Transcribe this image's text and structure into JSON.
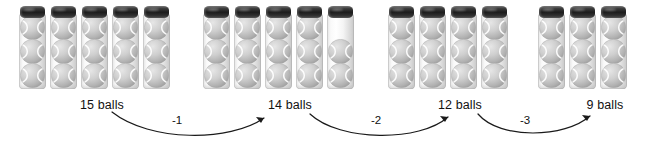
{
  "figure": {
    "background_color": "#ffffff",
    "text_color": "#111111"
  },
  "chart_data": {
    "type": "bar",
    "xlabel": "",
    "ylabel": "balls",
    "categories": [
      "15 balls",
      "14 balls",
      "12 balls",
      "9 balls"
    ],
    "values": [
      15,
      14,
      12,
      9
    ],
    "series": [
      {
        "name": "balls",
        "values": [
          15,
          14,
          12,
          9
        ]
      }
    ],
    "deltas": [
      -1,
      -2,
      -3
    ],
    "grid": false,
    "legend_position": "none",
    "annotations": [
      "-1",
      "-2",
      "-3"
    ]
  },
  "groups": [
    {
      "id": "group-1",
      "label": "15 balls",
      "total": 15,
      "tube_count": 5,
      "tubes": [
        3,
        3,
        3,
        3,
        3
      ],
      "label_x": 102
    },
    {
      "id": "group-2",
      "label": "14 balls",
      "total": 14,
      "tube_count": 5,
      "tubes": [
        3,
        3,
        3,
        3,
        2
      ],
      "label_x": 290
    },
    {
      "id": "group-3",
      "label": "12 balls",
      "total": 12,
      "tube_count": 4,
      "tubes": [
        3,
        3,
        3,
        3
      ],
      "label_x": 460
    },
    {
      "id": "group-4",
      "label": "9 balls",
      "total": 9,
      "tube_count": 3,
      "tubes": [
        3,
        3,
        3
      ],
      "label_x": 605
    }
  ],
  "arrows": [
    {
      "id": "arrow-1",
      "label": "-1",
      "from": "15 balls",
      "to": "14 balls",
      "label_x": 177
    },
    {
      "id": "arrow-2",
      "label": "-2",
      "from": "14 balls",
      "to": "12 balls",
      "label_x": 376
    },
    {
      "id": "arrow-3",
      "label": "-3",
      "from": "12 balls",
      "to": "9 balls",
      "label_x": 525
    }
  ],
  "icons": {
    "tennis_ball": "tennis-ball-icon",
    "tube_cap": "tube-cap-icon",
    "arrow_head": "arrow-head-icon"
  },
  "colors": {
    "cap_dark": "#1c1c1c",
    "ball_gray": "#bdbdbd",
    "ball_seam": "#ffffff",
    "arrow_stroke": "#1a1a1a"
  }
}
